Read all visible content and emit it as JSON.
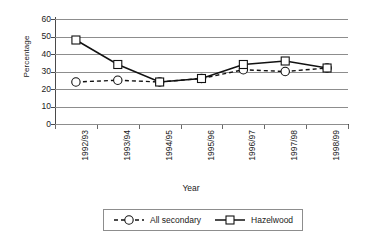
{
  "chart_data": {
    "type": "line",
    "title": "",
    "xlabel": "Year",
    "ylabel": "Percentage",
    "categories": [
      "1992/93",
      "1993/94",
      "1994/95",
      "1995/96",
      "1996/97",
      "1997/98",
      "1998/99"
    ],
    "series": [
      {
        "name": "All secondary",
        "values": [
          24,
          25,
          24,
          26,
          31,
          30,
          32
        ],
        "marker": "circle",
        "line_style": "dashed",
        "color": "#111111"
      },
      {
        "name": "Hazelwood",
        "values": [
          48,
          34,
          24,
          26,
          34,
          36,
          32
        ],
        "marker": "square",
        "line_style": "solid",
        "color": "#111111"
      }
    ],
    "ylim": [
      0,
      60
    ],
    "ytick_step": 10,
    "yticks": [
      0,
      10,
      20,
      30,
      40,
      50,
      60
    ],
    "ytick_labels": [
      "0",
      "10",
      "20",
      "30",
      "40",
      "50",
      "60"
    ],
    "grid": true,
    "grid_axis": "y",
    "legend_position": "bottom",
    "xtick_rotation": 90,
    "gridline_color": "#8d8d8d",
    "axis_color": "#4a4a4a",
    "background_color": "#ffffff"
  },
  "legend": {
    "entries": [
      {
        "label": "All secondary"
      },
      {
        "label": "Hazelwood"
      }
    ]
  }
}
